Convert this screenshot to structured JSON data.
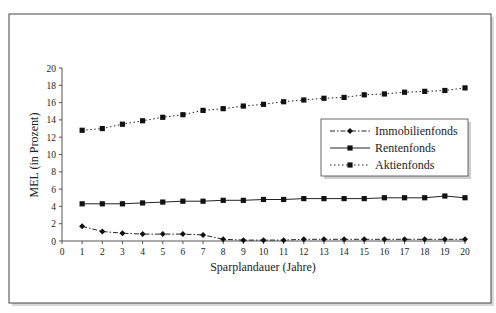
{
  "chart_data": {
    "type": "line",
    "title": "",
    "xlabel": "Sparplandauer (Jahre)",
    "ylabel": "MEL (in Prozent)",
    "xlim": [
      0,
      20
    ],
    "ylim": [
      0,
      20
    ],
    "x_ticks": [
      0,
      1,
      2,
      3,
      4,
      5,
      6,
      7,
      8,
      9,
      10,
      11,
      12,
      13,
      14,
      15,
      16,
      17,
      18,
      19,
      20
    ],
    "y_ticks": [
      0,
      2,
      4,
      6,
      8,
      10,
      12,
      14,
      16,
      18,
      20
    ],
    "grid": false,
    "legend_position": "right-middle, inside plot",
    "x": [
      1,
      2,
      3,
      4,
      5,
      6,
      7,
      8,
      9,
      10,
      11,
      12,
      13,
      14,
      15,
      16,
      17,
      18,
      19,
      20
    ],
    "series": [
      {
        "name": "Immobilienfonds",
        "line_style": "dash-dot",
        "marker": "diamond",
        "values": [
          1.7,
          1.1,
          0.9,
          0.8,
          0.8,
          0.8,
          0.7,
          0.2,
          0.1,
          0.1,
          0.1,
          0.2,
          0.2,
          0.2,
          0.2,
          0.2,
          0.2,
          0.2,
          0.2,
          0.2
        ]
      },
      {
        "name": "Rentenfonds",
        "line_style": "solid",
        "marker": "square",
        "values": [
          4.3,
          4.3,
          4.3,
          4.4,
          4.5,
          4.6,
          4.6,
          4.7,
          4.7,
          4.8,
          4.8,
          4.9,
          4.9,
          4.9,
          4.9,
          5.0,
          5.0,
          5.0,
          5.2,
          5.0
        ]
      },
      {
        "name": "Aktienfonds",
        "line_style": "dotted",
        "marker": "square",
        "values": [
          12.8,
          13.0,
          13.5,
          13.9,
          14.3,
          14.6,
          15.1,
          15.3,
          15.6,
          15.8,
          16.1,
          16.3,
          16.5,
          16.6,
          16.9,
          17.0,
          17.2,
          17.3,
          17.4,
          17.7
        ]
      }
    ]
  },
  "labels": {
    "ylabel": "MEL (in Prozent)",
    "xlabel": "Sparplandauer (Jahre)",
    "legend": [
      "Immobilienfonds",
      "Rentenfonds",
      "Aktienfonds"
    ]
  }
}
